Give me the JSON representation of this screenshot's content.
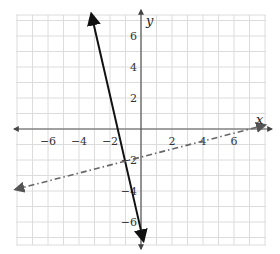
{
  "chart_data": {
    "type": "line",
    "title": "",
    "xlabel": "x",
    "ylabel": "y",
    "xlim": [
      -8,
      8
    ],
    "ylim": [
      -7.4,
      7.4
    ],
    "grid": true,
    "x_ticks": [
      -6,
      -4,
      -2,
      2,
      4,
      6
    ],
    "y_ticks": [
      6,
      4,
      2,
      -2,
      -4,
      -6
    ],
    "series": [
      {
        "name": "solid line",
        "style": "solid",
        "color": "#111111",
        "x": [
          -3.2,
          0.15
        ],
        "y": [
          7.4,
          -7.2
        ],
        "arrows": "both"
      },
      {
        "name": "dash-dot line",
        "style": "dashdot",
        "color": "#666666",
        "x": [
          -8.1,
          8.0
        ],
        "y": [
          -3.9,
          0.25
        ],
        "arrows": "both"
      }
    ]
  },
  "labels": {
    "x_axis": "x",
    "y_axis": "y"
  }
}
